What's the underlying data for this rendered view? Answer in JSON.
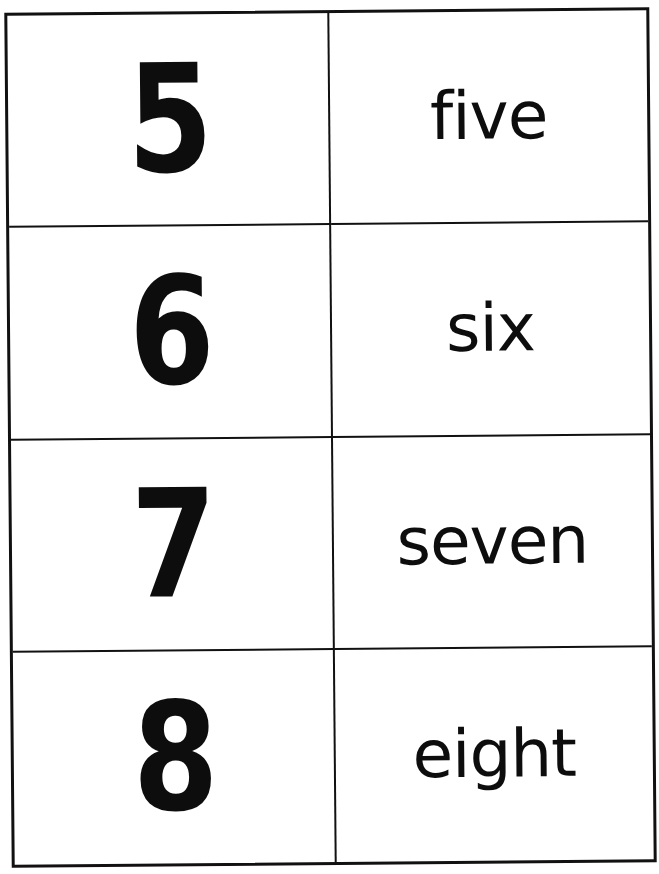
{
  "flashcards": {
    "rows": [
      {
        "numeral": "5",
        "word": "five"
      },
      {
        "numeral": "6",
        "word": "six"
      },
      {
        "numeral": "7",
        "word": "seven"
      },
      {
        "numeral": "8",
        "word": "eight"
      }
    ]
  },
  "colors": {
    "ink": "#0d0d0d",
    "border": "#111111",
    "background": "#ffffff"
  }
}
